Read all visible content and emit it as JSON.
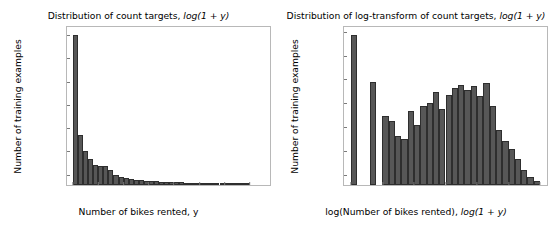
{
  "figure": {
    "background": "#ffffff",
    "bar_color": "#575757",
    "bar_edge_color": "#2e2e2e",
    "axis_color": "#b8b8b8"
  },
  "chart_data": [
    {
      "type": "bar",
      "id": "count-targets-histogram",
      "title": "Distribution of count targets, log(1 + y)",
      "title_plain": "Distribution of count targets,",
      "title_math": "log(1 + y)",
      "xlabel": "Number of bikes rented, y",
      "ylabel": "Number of training examples",
      "xlim": [
        -12,
        390
      ],
      "ylim": [
        0,
        6800
      ],
      "grid": false,
      "legend": null,
      "xticks": [
        0,
        50,
        100,
        150,
        200,
        250,
        300,
        350
      ],
      "xticklabels": [
        "0",
        "50",
        "100",
        "150",
        "200",
        "250",
        "300",
        "350"
      ],
      "yticks": [
        0,
        1000,
        2000,
        3000,
        4000,
        5000,
        6000
      ],
      "yticklabels": [
        "0",
        "1000",
        "2000",
        "3000",
        "4000",
        "5000",
        "6000"
      ],
      "bin_width": 10,
      "bin_starts": [
        0,
        10,
        20,
        30,
        40,
        50,
        60,
        70,
        80,
        90,
        100,
        110,
        120,
        130,
        140,
        150,
        160,
        170,
        180,
        190,
        200,
        210,
        220,
        230,
        240,
        250,
        260,
        270,
        280,
        290,
        300,
        310,
        320,
        330,
        340
      ],
      "categories": [
        "0-10",
        "10-20",
        "20-30",
        "30-40",
        "40-50",
        "50-60",
        "60-70",
        "70-80",
        "80-90",
        "90-100",
        "100-110",
        "110-120",
        "120-130",
        "130-140",
        "140-150",
        "150-160",
        "160-170",
        "170-180",
        "180-190",
        "190-200",
        "200-210",
        "210-220",
        "220-230",
        "230-240",
        "240-250",
        "250-260",
        "260-270",
        "270-280",
        "280-290",
        "290-300",
        "300-310",
        "310-320",
        "320-330",
        "330-340",
        "340-350"
      ],
      "values": [
        6450,
        2150,
        1470,
        1140,
        870,
        820,
        800,
        640,
        430,
        330,
        300,
        250,
        230,
        200,
        185,
        175,
        165,
        150,
        140,
        130,
        120,
        110,
        100,
        95,
        90,
        85,
        80,
        70,
        65,
        60,
        50,
        45,
        35,
        25,
        15
      ]
    },
    {
      "type": "bar",
      "id": "log-transform-histogram",
      "title": "Distribution of log-transform of count targets, log(1 + y)",
      "title_plain": "Distribution of log-transform of count targets,",
      "title_math": "log(1 + y)",
      "xlabel": "log(Number of bikes rented), log(1 + y)",
      "xlabel_plain": "log(Number of bikes rented),",
      "xlabel_math": "log(1 + y)",
      "ylabel": "Number of training examples",
      "xlim": [
        -0.22,
        6.22
      ],
      "ylim": [
        0,
        1330
      ],
      "grid": false,
      "legend": null,
      "xticks": [
        0,
        1,
        2,
        3,
        4,
        5,
        6
      ],
      "xticklabels": [
        "0",
        "1",
        "2",
        "3",
        "4",
        "5",
        "6"
      ],
      "yticks": [
        0,
        200,
        400,
        600,
        800,
        1000,
        1200
      ],
      "yticklabels": [
        "0",
        "200",
        "400",
        "600",
        "800",
        "1000",
        "1200"
      ],
      "bin_width": 0.2,
      "bin_starts": [
        0.0,
        0.2,
        0.4,
        0.6,
        0.8,
        1.0,
        1.2,
        1.4,
        1.6,
        1.8,
        2.0,
        2.2,
        2.4,
        2.6,
        2.8,
        3.0,
        3.2,
        3.4,
        3.6,
        3.8,
        4.0,
        4.2,
        4.4,
        4.6,
        4.8,
        5.0,
        5.2,
        5.4,
        5.6,
        5.8
      ],
      "categories": [
        "0.0",
        "0.2",
        "0.4",
        "0.6",
        "0.8",
        "1.0",
        "1.2",
        "1.4",
        "1.6",
        "1.8",
        "2.0",
        "2.2",
        "2.4",
        "2.6",
        "2.8",
        "3.0",
        "3.2",
        "3.4",
        "3.6",
        "3.8",
        "4.0",
        "4.2",
        "4.4",
        "4.6",
        "4.8",
        "5.0",
        "5.2",
        "5.4",
        "5.6",
        "5.8"
      ],
      "values": [
        1265,
        0,
        0,
        870,
        0,
        585,
        535,
        415,
        390,
        625,
        505,
        665,
        690,
        780,
        640,
        755,
        820,
        840,
        800,
        835,
        750,
        860,
        665,
        460,
        370,
        300,
        215,
        130,
        70,
        35
      ]
    }
  ]
}
